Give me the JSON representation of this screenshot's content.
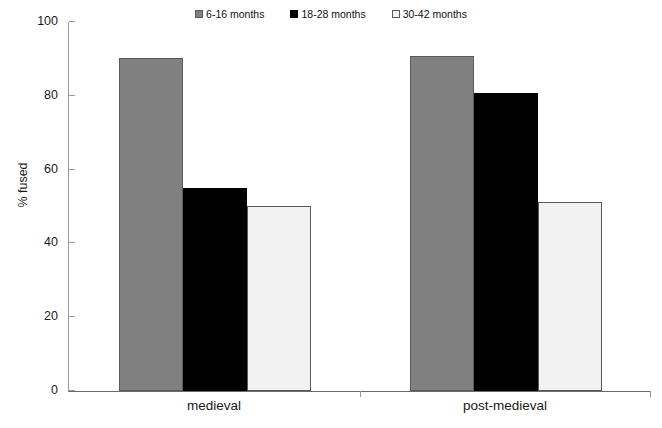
{
  "chart_data": {
    "type": "bar",
    "title": "",
    "subtitle": "",
    "xlabel": "",
    "ylabel": "% fused",
    "categories": [
      "medieval",
      "post-medieval"
    ],
    "series": [
      {
        "name": "6-16 months",
        "values": [
          90,
          90.5
        ],
        "color": "#808080",
        "border": "#5a5a5a"
      },
      {
        "name": "18-28 months",
        "values": [
          55,
          80.5
        ],
        "color": "#000000",
        "border": "#000000"
      },
      {
        "name": "30-42 months",
        "values": [
          50,
          51
        ],
        "color": "#f2f2f2",
        "border": "#595959"
      }
    ],
    "ylim": [
      0,
      100
    ],
    "yticks": [
      0,
      20,
      40,
      60,
      80,
      100
    ],
    "ytick_labels": [
      "0",
      "20",
      "40",
      "60",
      "80",
      "100"
    ],
    "grid": false,
    "legend_position": "top-center",
    "axis_color": "#6b6b6b",
    "background": "#ffffff"
  },
  "caption": {
    "text": ""
  }
}
